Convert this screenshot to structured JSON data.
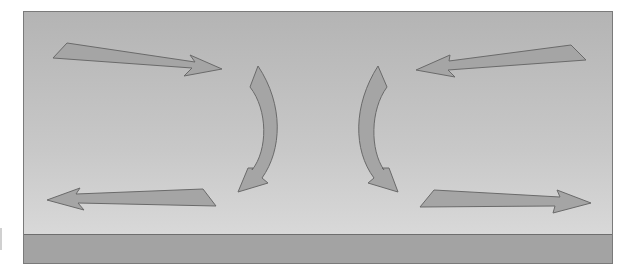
{
  "diagram": {
    "colors": {
      "background_top": "#b4b4b4",
      "background_bottom": "#dedede",
      "ground_band": "#a3a3a3",
      "arrow_fill": "#a5a5a5",
      "arrow_stroke": "#6a6a6a",
      "frame_border": "#7a7a7a"
    },
    "arrows": [
      {
        "id": "top-left",
        "direction": "right-inward",
        "shape": "straight"
      },
      {
        "id": "top-right",
        "direction": "left-inward",
        "shape": "straight"
      },
      {
        "id": "center-left",
        "direction": "down",
        "shape": "curved"
      },
      {
        "id": "center-right",
        "direction": "down",
        "shape": "curved"
      },
      {
        "id": "bottom-left",
        "direction": "left-outward",
        "shape": "straight"
      },
      {
        "id": "bottom-right",
        "direction": "right-outward",
        "shape": "straight"
      }
    ]
  }
}
